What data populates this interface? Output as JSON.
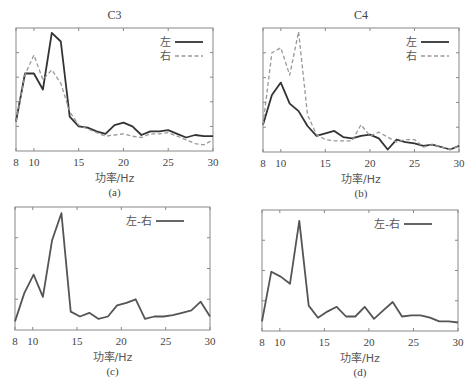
{
  "chart_data": [
    {
      "id": "a",
      "type": "line",
      "title": "C3",
      "caption": "(a)",
      "xlabel": "功率/Hz",
      "ylabel": "",
      "xlim": [
        8,
        30
      ],
      "ylim": [
        0,
        1
      ],
      "xticks": [
        8,
        10,
        15,
        20,
        25,
        30
      ],
      "yticks_count": 5,
      "legend_position": "upper right",
      "box": {
        "x0": 16,
        "x1": 213,
        "y0": 28,
        "y1": 151
      },
      "x": [
        8,
        9,
        10,
        11,
        12,
        13,
        14,
        15,
        16,
        17,
        18,
        19,
        20,
        21,
        22,
        23,
        24,
        25,
        26,
        27,
        28,
        29,
        30
      ],
      "series": [
        {
          "name": "左",
          "style": "solid",
          "color": "#333333",
          "values": [
            0.24,
            0.63,
            0.63,
            0.5,
            0.96,
            0.89,
            0.28,
            0.2,
            0.19,
            0.16,
            0.14,
            0.21,
            0.23,
            0.2,
            0.13,
            0.16,
            0.16,
            0.17,
            0.14,
            0.11,
            0.13,
            0.12,
            0.12
          ]
        },
        {
          "name": "右",
          "style": "dashed",
          "color": "#999999",
          "values": [
            0.24,
            0.62,
            0.78,
            0.58,
            0.66,
            0.55,
            0.32,
            0.21,
            0.18,
            0.15,
            0.12,
            0.13,
            0.14,
            0.12,
            0.11,
            0.14,
            0.14,
            0.15,
            0.12,
            0.09,
            0.06,
            0.05,
            0.09
          ]
        }
      ]
    },
    {
      "id": "b",
      "type": "line",
      "title": "C4",
      "caption": "(b)",
      "xlabel": "功率/Hz",
      "ylabel": "",
      "xlim": [
        8,
        30
      ],
      "ylim": [
        0,
        1
      ],
      "xticks": [
        8,
        10,
        15,
        20,
        25,
        30
      ],
      "yticks_count": 5,
      "legend_position": "upper right",
      "box": {
        "x0": 263,
        "x1": 459,
        "y0": 28,
        "y1": 152
      },
      "x": [
        8,
        9,
        10,
        11,
        12,
        13,
        14,
        15,
        16,
        17,
        18,
        19,
        20,
        21,
        22,
        23,
        24,
        25,
        26,
        27,
        28,
        29,
        30
      ],
      "series": [
        {
          "name": "左",
          "style": "solid",
          "color": "#333333",
          "values": [
            0.22,
            0.46,
            0.56,
            0.39,
            0.33,
            0.21,
            0.13,
            0.15,
            0.17,
            0.12,
            0.11,
            0.13,
            0.14,
            0.11,
            0.02,
            0.1,
            0.08,
            0.07,
            0.05,
            0.06,
            0.04,
            0.02,
            0.05
          ]
        },
        {
          "name": "右",
          "style": "dashed",
          "color": "#999999",
          "values": [
            0.22,
            0.8,
            0.84,
            0.62,
            0.97,
            0.3,
            0.14,
            0.1,
            0.09,
            0.09,
            0.09,
            0.22,
            0.13,
            0.16,
            0.12,
            0.08,
            0.1,
            0.1,
            0.04,
            0.06,
            0.04,
            0.02,
            0.05
          ]
        }
      ]
    },
    {
      "id": "c",
      "type": "line",
      "title": "",
      "caption": "(c)",
      "xlabel": "功率/Hz",
      "ylabel": "",
      "xlim": [
        8,
        30
      ],
      "ylim": [
        0,
        1
      ],
      "xticks": [
        8,
        10,
        15,
        20,
        25,
        30
      ],
      "yticks_count": 4,
      "legend_position": "upper right",
      "box": {
        "x0": 15,
        "x1": 210,
        "y0": 207,
        "y1": 330
      },
      "x": [
        8,
        9,
        10,
        11,
        12,
        13,
        14,
        15,
        16,
        17,
        18,
        19,
        20,
        21,
        22,
        23,
        24,
        25,
        26,
        27,
        28,
        29,
        30
      ],
      "series": [
        {
          "name": "左-右",
          "style": "solid",
          "color": "#555555",
          "values": [
            0.07,
            0.3,
            0.45,
            0.27,
            0.73,
            0.95,
            0.15,
            0.11,
            0.14,
            0.09,
            0.11,
            0.2,
            0.22,
            0.25,
            0.09,
            0.11,
            0.11,
            0.12,
            0.14,
            0.16,
            0.23,
            0.11
          ]
        }
      ]
    },
    {
      "id": "d",
      "type": "line",
      "title": "",
      "caption": "(d)",
      "xlabel": "功率/Hz",
      "ylabel": "",
      "xlim": [
        8,
        30
      ],
      "ylim": [
        0,
        1
      ],
      "xticks": [
        8,
        10,
        15,
        20,
        25,
        30
      ],
      "yticks_count": 4,
      "legend_position": "upper right",
      "box": {
        "x0": 262,
        "x1": 458,
        "y0": 210,
        "y1": 331
      },
      "x": [
        8,
        9,
        10,
        11,
        12,
        13,
        14,
        15,
        16,
        17,
        18,
        19,
        20,
        21,
        22,
        23,
        24,
        25,
        26,
        27,
        28,
        29,
        30
      ],
      "series": [
        {
          "name": "左-右",
          "style": "solid",
          "color": "#555555",
          "values": [
            0.08,
            0.49,
            0.45,
            0.39,
            0.91,
            0.21,
            0.11,
            0.16,
            0.2,
            0.12,
            0.12,
            0.2,
            0.1,
            0.17,
            0.24,
            0.12,
            0.13,
            0.13,
            0.11,
            0.08,
            0.08,
            0.07
          ]
        }
      ]
    }
  ]
}
